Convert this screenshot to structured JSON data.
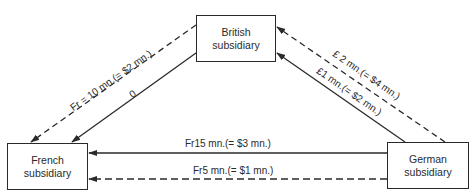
{
  "nodes": {
    "british": {
      "line1": "British",
      "line2": "subsidiary"
    },
    "french": {
      "line1": "French",
      "line2": "subsidiary"
    },
    "german": {
      "line1": "German",
      "line2": "subsidiary"
    }
  },
  "flows": {
    "british_to_french_dashed": "Fr = 10 mn.(= $2 mn.)",
    "british_to_french_solid": "0",
    "german_to_british_dashed": "£ 2 mn.(= $4 mn.)",
    "german_to_british_solid": "£1 mn.(= $2 mn.)",
    "german_to_french_solid": "Fr15 mn.(= $3 mn.)",
    "german_to_french_dashed": "Fr5 mn.(= $1 mn.)"
  },
  "legend": {
    "solid": "solid line",
    "dashed": "dashed line"
  }
}
